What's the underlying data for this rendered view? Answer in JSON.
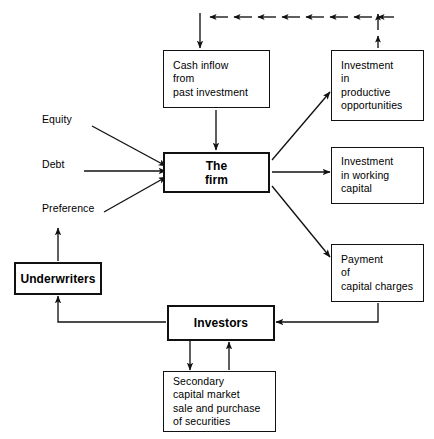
{
  "diagram": {
    "line_color": "#111111",
    "box_fill": "#ffffff",
    "text_color": "#000000",
    "nodes": {
      "cash_inflow": {
        "label": "Cash inflow\nfrom\npast investment"
      },
      "the_firm": {
        "label": "The\nfirm"
      },
      "investment_productive": {
        "label": "Investment\nin\nproductive\nopportunities"
      },
      "investment_working": {
        "label": "Investment\nin working\ncapital"
      },
      "payment_capital_charges": {
        "label": "Payment\nof\ncapital charges"
      },
      "underwriters": {
        "label": "Underwriters"
      },
      "investors": {
        "label": "Investors"
      },
      "secondary_market": {
        "label": "Secondary\ncapital market\nsale and purchase\nof  securities"
      }
    },
    "labels": {
      "equity": "Equity",
      "debt": "Debt",
      "preference": "Preference"
    }
  }
}
